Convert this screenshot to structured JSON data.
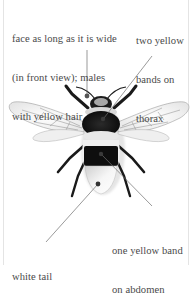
{
  "diagram": {
    "colors": {
      "text": "#4a4a4a",
      "leader_line": "#6e6e6e",
      "bee_black": "#111111",
      "wing": "#f1f1f1",
      "tail": "#f4f4f4",
      "marker_dot": "#444444"
    },
    "callouts": [
      {
        "id": "face",
        "lines": [
          "face as long as it is wide",
          "(in front view); males",
          "with yellow hair"
        ],
        "target": "head"
      },
      {
        "id": "thorax",
        "lines": [
          "two yellow",
          "bands on",
          "thorax"
        ],
        "target": "thorax"
      },
      {
        "id": "abdomen",
        "lines": [
          "one yellow band",
          "on abdomen"
        ],
        "target": "abdomen"
      },
      {
        "id": "tail",
        "lines": [
          "white tail"
        ],
        "target": "tail"
      }
    ]
  }
}
